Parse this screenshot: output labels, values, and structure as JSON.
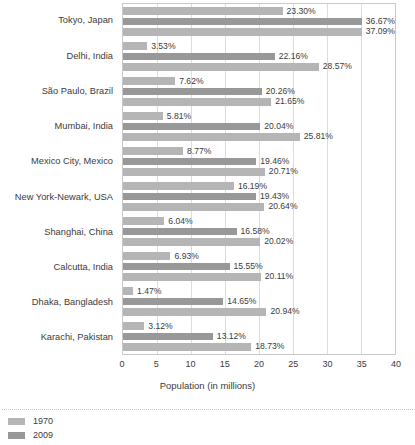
{
  "chart_data": {
    "type": "bar",
    "orientation": "horizontal",
    "title": "",
    "xlabel": "Population (in millions)",
    "ylabel": "",
    "xlim": [
      0,
      40
    ],
    "xticks": [
      0,
      5,
      10,
      15,
      20,
      25,
      30,
      35,
      40
    ],
    "xtick_labels": [
      "0",
      "5",
      "10",
      "15",
      "20",
      "25",
      "30",
      "35",
      "40"
    ],
    "grid": true,
    "legend_position": "bottom-left",
    "categories": [
      "Tokyo, Japan",
      "Delhi, India",
      "São Paulo, Brazil",
      "Mumbai, India",
      "Mexico City, Mexico",
      "New York-Newark, USA",
      "Shanghai, China",
      "Calcutta, India",
      "Dhaka, Bangladesh",
      "Karachi, Pakistan"
    ],
    "series": [
      {
        "name": "1970",
        "color": "#b5b5b5",
        "values": [
          23.3,
          3.53,
          7.62,
          5.81,
          8.77,
          16.19,
          6.04,
          6.93,
          1.47,
          3.12
        ],
        "labels": [
          "23.30%",
          "3.53%",
          "7.62%",
          "5.81%",
          "8.77%",
          "16.19%",
          "6.04%",
          "6.93%",
          "1.47%",
          "3.12%"
        ]
      },
      {
        "name": "2009",
        "color": "#989898",
        "values": [
          36.67,
          22.16,
          20.26,
          20.04,
          19.46,
          19.43,
          16.58,
          15.55,
          14.65,
          13.12
        ],
        "labels": [
          "36.67%",
          "22.16%",
          "20.26%",
          "20.04%",
          "19.46%",
          "19.43%",
          "16.58%",
          "15.55%",
          "14.65%",
          "13.12%"
        ]
      },
      {
        "name": "2025",
        "color": "#b5b5b5",
        "values": [
          37.09,
          28.57,
          21.65,
          25.81,
          20.71,
          20.64,
          20.02,
          20.11,
          20.94,
          18.73
        ],
        "labels": [
          "37.09%",
          "28.57%",
          "21.65%",
          "25.81%",
          "20.71%",
          "20.64%",
          "20.02%",
          "20.11%",
          "20.94%",
          "18.73%"
        ]
      }
    ]
  },
  "legend": {
    "entries": [
      {
        "label": "1970",
        "color": "#b5b5b5"
      },
      {
        "label": "2009",
        "color": "#989898"
      }
    ]
  },
  "colors": {
    "light_bar": "#b5b5b5",
    "dark_bar": "#989898",
    "gridline": "#dcdcdc",
    "axis_border": "#c9c9c9",
    "text": "#3b3b3b",
    "background": "#ffffff"
  }
}
